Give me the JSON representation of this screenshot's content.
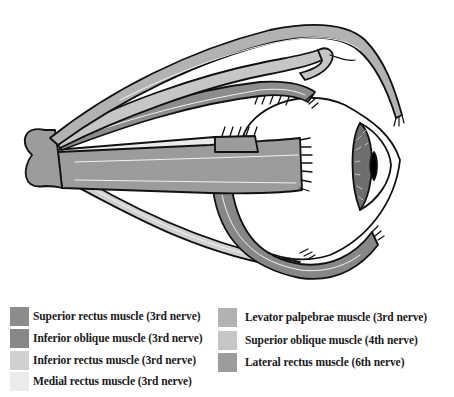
{
  "figure": {
    "structures": [
      {
        "id": "annulus",
        "name": "Common tendinous ring (origin)"
      },
      {
        "id": "eyeball",
        "name": "Eyeball"
      },
      {
        "id": "iris",
        "name": "Iris / pupil"
      }
    ]
  },
  "colors": {
    "outline": "#111111",
    "fiber": "#f2f2f2",
    "superior_rectus": "#8c8c8c",
    "inferior_oblique": "#878787",
    "inferior_rectus": "#d0d0d0",
    "medial_rectus": "#ebebeb",
    "levator_palpebrae": "#b2b2b2",
    "superior_oblique": "#c6c6c6",
    "lateral_rectus": "#9c9c9c",
    "iris": "#6e6e6e",
    "pupil": "#000000"
  },
  "legend": {
    "left": [
      {
        "label": "Superior rectus muscle (3rd nerve)",
        "color": "#8c8c8c"
      },
      {
        "label": "Inferior oblique muscle (3rd nerve)",
        "color": "#878787"
      },
      {
        "label": "Inferior rectus muscle (3rd nerve)",
        "color": "#d0d0d0"
      },
      {
        "label": "Medial rectus muscle (3rd nerve)",
        "color": "#ebebeb"
      }
    ],
    "right": [
      {
        "label": "Levator palpebrae muscle (3rd nerve)",
        "color": "#b2b2b2"
      },
      {
        "label": "Superior oblique muscle (4th nerve)",
        "color": "#c6c6c6"
      },
      {
        "label": "Lateral rectus muscle (6th nerve)",
        "color": "#9c9c9c"
      }
    ]
  }
}
